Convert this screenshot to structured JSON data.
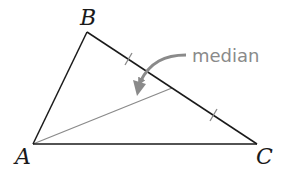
{
  "diagram": {
    "type": "triangle-median",
    "vertices": {
      "A": {
        "label": "A",
        "x": 33,
        "y": 144
      },
      "B": {
        "label": "B",
        "x": 87,
        "y": 32
      },
      "C": {
        "label": "C",
        "x": 257,
        "y": 144
      }
    },
    "median": {
      "from": "A",
      "to_midpoint_of": "BC",
      "label": "median"
    },
    "tick_marks": {
      "count": 2,
      "segments": [
        "BM",
        "MC"
      ]
    },
    "colors": {
      "triangle": "#1a1a1a",
      "median": "#8a8a8a",
      "annotation": "#8a8a8a"
    }
  }
}
